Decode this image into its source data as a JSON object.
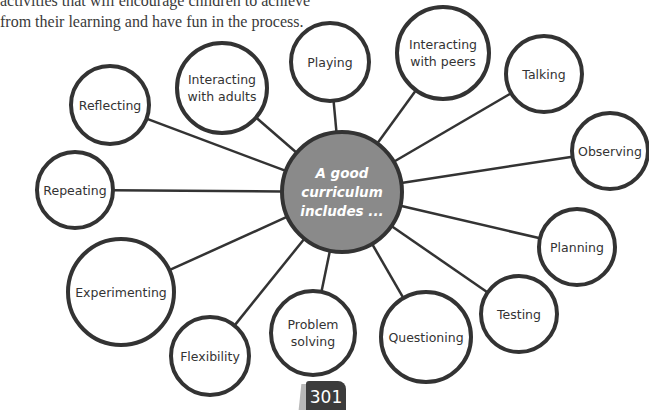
{
  "intro_text": {
    "line1": "activities that will encourage children to achieve",
    "line2": "from their learning and have fun in the process."
  },
  "center": {
    "label": "A good\ncurriculum\nincludes ...",
    "x": 342,
    "y": 192,
    "r": 60,
    "fill": "#8a8a8a",
    "stroke": "#333333"
  },
  "nodes": [
    {
      "label": "Reflecting",
      "x": 110,
      "y": 105,
      "r": 39
    },
    {
      "label": "Interacting\nwith adults",
      "x": 222,
      "y": 88,
      "r": 45
    },
    {
      "label": "Playing",
      "x": 330,
      "y": 62,
      "r": 39
    },
    {
      "label": "Interacting\nwith peers",
      "x": 443,
      "y": 53,
      "r": 46
    },
    {
      "label": "Talking",
      "x": 544,
      "y": 74,
      "r": 38
    },
    {
      "label": "Observing",
      "x": 610,
      "y": 151,
      "r": 38
    },
    {
      "label": "Planning",
      "x": 577,
      "y": 247,
      "r": 38
    },
    {
      "label": "Testing",
      "x": 519,
      "y": 314,
      "r": 38
    },
    {
      "label": "Questioning",
      "x": 426,
      "y": 337,
      "r": 45
    },
    {
      "label": "Problem\nsolving",
      "x": 313,
      "y": 333,
      "r": 42
    },
    {
      "label": "Flexibility",
      "x": 210,
      "y": 356,
      "r": 39
    },
    {
      "label": "Experimenting",
      "x": 121,
      "y": 292,
      "r": 53
    },
    {
      "label": "Repeating",
      "x": 75,
      "y": 190,
      "r": 38
    }
  ],
  "page_number": "301",
  "colors": {
    "stroke": "#333333",
    "node_fill": "#ffffff",
    "text": "#333333"
  }
}
